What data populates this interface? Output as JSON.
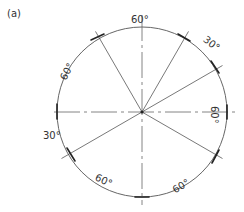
{
  "figure": {
    "label": "(a)",
    "center": [
      142,
      112
    ],
    "radius": 85,
    "colors": {
      "line": "#555555",
      "text": "#333333",
      "arrow": "#222222"
    }
  },
  "centerlines_deg": [
    0,
    90,
    180,
    270
  ],
  "radials_deg": [
    120,
    60,
    30,
    -30,
    210
  ],
  "dimensions": [
    {
      "from": 120,
      "to": 60,
      "label": "60°"
    },
    {
      "from": 60,
      "to": 30,
      "label": "30°"
    },
    {
      "from": 30,
      "to": -30,
      "label": "60°"
    },
    {
      "from": -30,
      "to": -90,
      "label": "60°"
    },
    {
      "from": -90,
      "to": -150,
      "label": "60°"
    },
    {
      "from": 210,
      "to": 180,
      "label": "30°"
    },
    {
      "from": 180,
      "to": 120,
      "label": "60°"
    }
  ],
  "labels": {
    "top": "60°",
    "upper_right": "30°",
    "right": "60°",
    "lower_right": "60°",
    "lower_left": "60°",
    "left": "30°",
    "upper_left": "60°"
  }
}
